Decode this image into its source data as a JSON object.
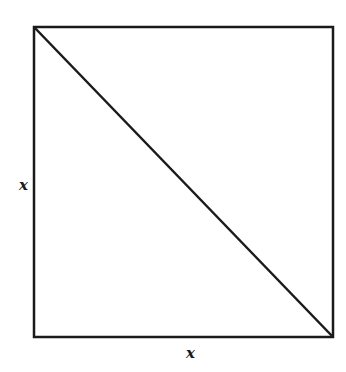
{
  "diagram": {
    "shape": "square",
    "has_diagonal": true,
    "diagonal": "top-left to bottom-right",
    "labels": {
      "left_side": "x",
      "bottom_side": "x"
    },
    "stroke_color": "#1a1a1a",
    "background": "#ffffff"
  }
}
